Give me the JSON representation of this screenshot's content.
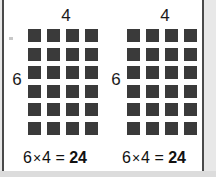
{
  "card": {
    "background_color": "#ffffff",
    "border_color": "#4a4a4a",
    "page_background_color": "#e8e8e8",
    "square_color": "#3a3a3a"
  },
  "groups": [
    {
      "name": "left-array",
      "top_label": "4",
      "side_label": "6",
      "columns": 4,
      "rows": 6,
      "total_squares": 24,
      "equation": {
        "left_factor": "6",
        "operator": "×",
        "right_factor": "4",
        "equals": "=",
        "product": "24",
        "text": "6 × 4 = 24"
      }
    },
    {
      "name": "right-array",
      "top_label": "4",
      "side_label": "6",
      "columns": 4,
      "rows": 6,
      "total_squares": 24,
      "equation": {
        "left_factor": "6",
        "operator": "×",
        "right_factor": "4",
        "equals": "=",
        "product": "24",
        "text": "6 × 4 = 24"
      }
    }
  ]
}
